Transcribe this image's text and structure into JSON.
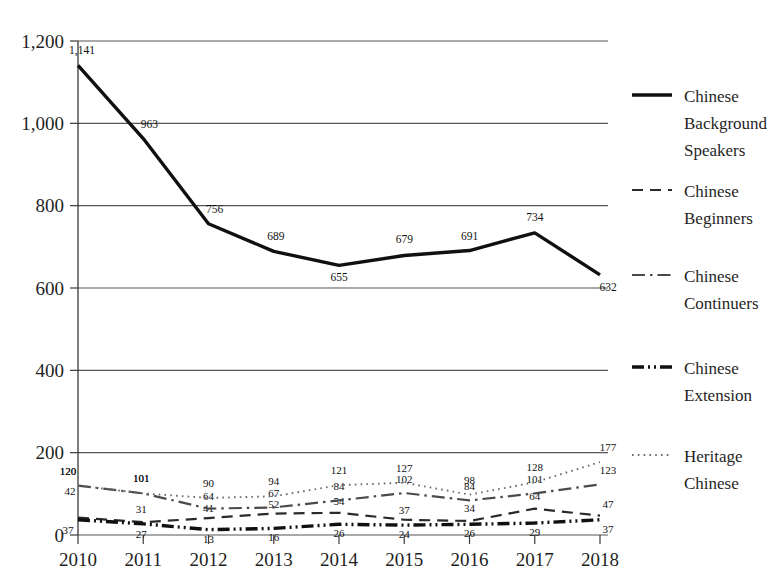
{
  "chart_data": {
    "type": "line",
    "title": "",
    "subtitle": "",
    "xlabel": "",
    "ylabel": "",
    "categories": [
      "2010",
      "2011",
      "2012",
      "2013",
      "2014",
      "2015",
      "2016",
      "2017",
      "2018"
    ],
    "x": [
      2010,
      2011,
      2012,
      2013,
      2014,
      2015,
      2016,
      2017,
      2018
    ],
    "ylim": [
      0,
      1200
    ],
    "xlim": [
      2010,
      2018
    ],
    "grid": true,
    "legend_position": "right",
    "yticks": [
      0,
      200,
      400,
      600,
      800,
      1000,
      1200
    ],
    "ytick_labels": [
      "0",
      "200",
      "400",
      "600",
      "800",
      "1,000",
      "1,200"
    ],
    "xtick_labels": [
      "2010",
      "2011",
      "2012",
      "2013",
      "2014",
      "2015",
      "2016",
      "2017",
      "2018"
    ],
    "series": [
      {
        "name": "Chinese Background Speakers",
        "style": "solid",
        "width": "thick",
        "color": "#101010",
        "values": [
          1141,
          963,
          756,
          689,
          655,
          679,
          691,
          734,
          632
        ],
        "labels": [
          "1,141",
          "963",
          "756",
          "689",
          "655",
          "679",
          "691",
          "734",
          "632"
        ]
      },
      {
        "name": "Chinese Beginners",
        "style": "dashed",
        "width": "medium",
        "color": "#2a2a2a",
        "values": [
          42,
          31,
          41,
          52,
          54,
          37,
          34,
          64,
          47
        ],
        "labels": [
          "42",
          "31",
          "41",
          "52",
          "54",
          "37",
          "34",
          "64",
          "47"
        ]
      },
      {
        "name": "Chinese Continuers",
        "style": "dashdot",
        "width": "medium",
        "color": "#4a4a4a",
        "values": [
          120,
          101,
          64,
          67,
          84,
          102,
          84,
          101,
          123
        ],
        "labels": [
          "120",
          "101",
          "64",
          "67",
          "84",
          "102",
          "84",
          "101",
          "123"
        ]
      },
      {
        "name": "Chinese Extension",
        "style": "dashdotdot",
        "width": "thick",
        "color": "#101010",
        "values": [
          37,
          27,
          13,
          16,
          26,
          24,
          26,
          29,
          37
        ],
        "labels": [
          "37",
          "27",
          "13",
          "16",
          "26",
          "24",
          "26",
          "29",
          "37"
        ]
      },
      {
        "name": "Heritage Chinese",
        "style": "dotted",
        "width": "thin",
        "color": "#6a6a6a",
        "values": [
          120,
          101,
          90,
          94,
          121,
          127,
          98,
          128,
          177
        ],
        "labels": [
          "120",
          "101",
          "90",
          "94",
          "121",
          "127",
          "98",
          "128",
          "177"
        ]
      }
    ]
  },
  "legend": {
    "items": [
      {
        "label_line1": "Chinese",
        "label_line2": "Background",
        "label_line3": "Speakers",
        "key": "chinese-background-speakers"
      },
      {
        "label_line1": "Chinese",
        "label_line2": "Beginners",
        "label_line3": "",
        "key": "chinese-beginners"
      },
      {
        "label_line1": "Chinese",
        "label_line2": "Continuers",
        "label_line3": "",
        "key": "chinese-continuers"
      },
      {
        "label_line1": "Chinese",
        "label_line2": "Extension",
        "label_line3": "",
        "key": "chinese-extension"
      },
      {
        "label_line1": "Heritage",
        "label_line2": "Chinese",
        "label_line3": "",
        "key": "heritage-chinese"
      }
    ]
  }
}
